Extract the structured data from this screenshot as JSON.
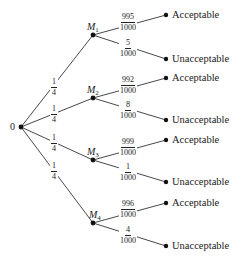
{
  "diagram": {
    "type": "probability-tree",
    "root": {
      "label": "0"
    },
    "first_level": [
      {
        "name": "M",
        "sub": "1",
        "prob_num": "1",
        "prob_den": "4",
        "outcomes": [
          {
            "num": "995",
            "den": "1000",
            "label": "Acceptable"
          },
          {
            "num": "5",
            "den": "1000",
            "label": "Unacceptable"
          }
        ]
      },
      {
        "name": "M",
        "sub": "2",
        "prob_num": "1",
        "prob_den": "4",
        "outcomes": [
          {
            "num": "992",
            "den": "1000",
            "label": "Acceptable"
          },
          {
            "num": "8",
            "den": "1000",
            "label": "Unacceptable"
          }
        ]
      },
      {
        "name": "M",
        "sub": "3",
        "prob_num": "1",
        "prob_den": "4",
        "outcomes": [
          {
            "num": "999",
            "den": "1000",
            "label": "Acceptable"
          },
          {
            "num": "1",
            "den": "1000",
            "label": "Unacceptable"
          }
        ]
      },
      {
        "name": "M",
        "sub": "4",
        "prob_num": "1",
        "prob_den": "4",
        "outcomes": [
          {
            "num": "996",
            "den": "1000",
            "label": "Acceptable"
          },
          {
            "num": "4",
            "den": "1000",
            "label": "Unacceptable"
          }
        ]
      }
    ]
  }
}
